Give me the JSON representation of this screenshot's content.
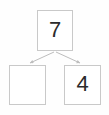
{
  "diagram": {
    "type": "number-bond",
    "title": "",
    "background_color": "#fefefe",
    "border_color": "#c9c9c9",
    "text_color": "#2b2b2b",
    "arrow_color": "#bdbdbd",
    "whole": {
      "label": "7",
      "filled": true
    },
    "parts": [
      {
        "label": "",
        "filled": false,
        "position": "left"
      },
      {
        "label": "4",
        "filled": true,
        "position": "right"
      }
    ],
    "connectors": [
      {
        "name": "arrow-to-left-part",
        "from": "whole",
        "to": "left-part"
      },
      {
        "name": "arrow-to-right-part",
        "from": "whole",
        "to": "right-part"
      }
    ]
  }
}
